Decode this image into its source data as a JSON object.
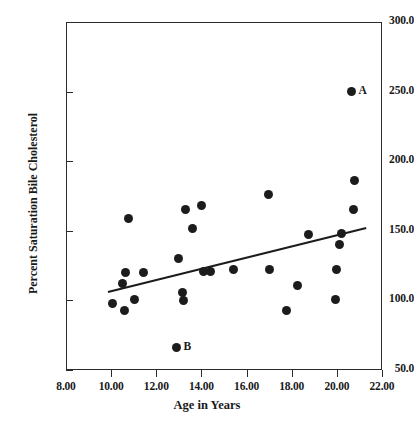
{
  "chart_data": {
    "type": "scatter",
    "title": "",
    "xlabel": "Age in Years",
    "ylabel": "Percent Saturation Bile Cholesterol",
    "xlim": [
      8.0,
      22.0
    ],
    "ylim": [
      50.0,
      300.0
    ],
    "xticks": [
      "8.00",
      "10.00",
      "12.00",
      "14.00",
      "16.00",
      "18.00",
      "20.00",
      "22.00"
    ],
    "yticks": [
      "50.0",
      "100.0",
      "150.0",
      "200.0",
      "250.0",
      "300.0"
    ],
    "xtick_values": [
      8.0,
      10.0,
      12.0,
      14.0,
      16.0,
      18.0,
      20.0,
      22.0
    ],
    "ytick_values": [
      50.0,
      100.0,
      150.0,
      200.0,
      250.0,
      300.0
    ],
    "grid": false,
    "legend": false,
    "marker_color": "#1c1c1c",
    "line_color": "#1c1c1c",
    "points": [
      {
        "x": 10.05,
        "y": 98
      },
      {
        "x": 10.5,
        "y": 112
      },
      {
        "x": 10.6,
        "y": 93
      },
      {
        "x": 10.65,
        "y": 120
      },
      {
        "x": 10.75,
        "y": 159
      },
      {
        "x": 11.05,
        "y": 101
      },
      {
        "x": 11.45,
        "y": 120
      },
      {
        "x": 13.0,
        "y": 130
      },
      {
        "x": 13.15,
        "y": 106
      },
      {
        "x": 13.2,
        "y": 100
      },
      {
        "x": 13.3,
        "y": 165
      },
      {
        "x": 13.6,
        "y": 152
      },
      {
        "x": 14.0,
        "y": 168
      },
      {
        "x": 14.1,
        "y": 121
      },
      {
        "x": 14.4,
        "y": 121
      },
      {
        "x": 15.4,
        "y": 122
      },
      {
        "x": 16.95,
        "y": 176
      },
      {
        "x": 17.0,
        "y": 122
      },
      {
        "x": 17.75,
        "y": 93
      },
      {
        "x": 18.25,
        "y": 111
      },
      {
        "x": 18.75,
        "y": 147
      },
      {
        "x": 19.95,
        "y": 101
      },
      {
        "x": 20.0,
        "y": 122
      },
      {
        "x": 20.1,
        "y": 140
      },
      {
        "x": 20.2,
        "y": 148
      },
      {
        "x": 20.75,
        "y": 165
      },
      {
        "x": 20.8,
        "y": 186
      },
      {
        "x": 20.65,
        "y": 250,
        "label": "A"
      },
      {
        "x": 12.9,
        "y": 66,
        "label": "B"
      }
    ],
    "trendline": {
      "x1": 9.86,
      "y1": 106,
      "x2": 21.3,
      "y2": 152
    }
  }
}
